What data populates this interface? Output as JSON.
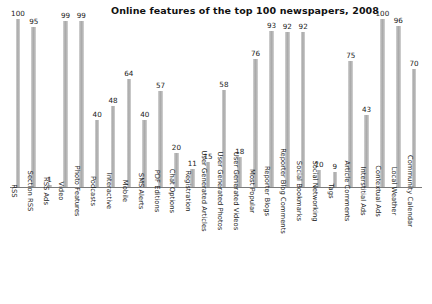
{
  "chart_data": {
    "type": "bar",
    "title": "Online features of the top 100 newspapers, 2008",
    "xlabel": "",
    "ylabel": "",
    "ylim": [
      0,
      100
    ],
    "grid": false,
    "legend": "none",
    "orientation": "vertical",
    "value_labels": true,
    "categories": [
      "RSS",
      "Section RSS",
      "RSS Ads",
      "Video",
      "Photo Features",
      "Podcasts",
      "Interactive",
      "Mobile",
      "SMS Alerts",
      "PDF Editions",
      "Chat Options",
      "Registration",
      "User Generated Articles",
      "User Generated Photos",
      "User Generated Videos",
      "Most Popular",
      "Reporter Blogs",
      "Reporter Blog Comments",
      "Social Bookmarks",
      "Social Networking",
      "Tags",
      "Article Comments",
      "Interstitial Ads",
      "Contextual Ads",
      "Local Weather",
      "Community Calendar"
    ],
    "values": [
      100,
      95,
      1,
      99,
      99,
      40,
      48,
      64,
      40,
      57,
      20,
      11,
      15,
      58,
      18,
      76,
      93,
      92,
      92,
      10,
      9,
      75,
      43,
      100,
      96,
      70
    ],
    "bar_color": "#b9b9b9",
    "axis_color": "#7a7a7a",
    "text_color": "#1a1a1a"
  }
}
